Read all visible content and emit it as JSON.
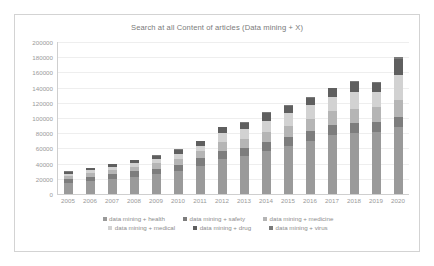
{
  "chart_data": {
    "type": "bar",
    "subtype": "stacked-column",
    "title": "Search at all Content of articles (Data mining + X)",
    "xlabel": "",
    "ylabel": "",
    "ylim": [
      0,
      200000
    ],
    "ytick_step": 20000,
    "yticks": [
      "200000",
      "180000",
      "160000",
      "140000",
      "120000",
      "100000",
      "80000",
      "60000",
      "40000",
      "20000",
      "0"
    ],
    "grid": true,
    "legend_position": "bottom",
    "categories": [
      "2005",
      "2006",
      "2007",
      "2008",
      "2009",
      "2010",
      "2011",
      "2012",
      "2013",
      "2014",
      "2015",
      "2016",
      "2017",
      "2018",
      "2019",
      "2020"
    ],
    "series": [
      {
        "name": "data mining + health",
        "color": "#9a9a9a",
        "values": [
          15000,
          17000,
          20000,
          23000,
          26000,
          30000,
          37000,
          46000,
          50000,
          57000,
          63000,
          70000,
          78000,
          80000,
          82000,
          88000
        ]
      },
      {
        "name": "data mining + safety",
        "color": "#7d7d7d",
        "values": [
          5000,
          6000,
          6500,
          7000,
          7500,
          8500,
          10000,
          11000,
          11000,
          12000,
          12500,
          13000,
          13000,
          13000,
          13000,
          14000
        ]
      },
      {
        "name": "data mining + medicine",
        "color": "#b5b5b5",
        "values": [
          4000,
          4500,
          5000,
          6000,
          7000,
          8000,
          9000,
          11000,
          12000,
          13000,
          14000,
          16000,
          18000,
          19000,
          19000,
          22000
        ]
      },
      {
        "name": "data mining + medical",
        "color": "#d2d2d2",
        "values": [
          3000,
          3500,
          4000,
          4500,
          5000,
          6000,
          7000,
          12000,
          12000,
          14000,
          17000,
          18000,
          19000,
          22000,
          20000,
          32000
        ]
      },
      {
        "name": "data mining + drug",
        "color": "#5f5f5f",
        "values": [
          2500,
          3000,
          3500,
          4000,
          5000,
          6000,
          6500,
          8000,
          9000,
          11000,
          10000,
          10000,
          11000,
          14000,
          12000,
          22000
        ]
      },
      {
        "name": "data mining + virus",
        "color": "#7a7a7a",
        "values": [
          400,
          400,
          500,
          500,
          600,
          600,
          600,
          700,
          700,
          800,
          900,
          900,
          900,
          1000,
          1000,
          2000
        ]
      }
    ],
    "totals": [
      29900,
      34400,
      39500,
      45000,
      51100,
      59100,
      70100,
      88700,
      94700,
      107800,
      117400,
      127900,
      139900,
      149000,
      147000,
      180000
    ]
  },
  "legend": {
    "row1": [
      {
        "label": "data mining + health",
        "color": "#9a9a9a"
      },
      {
        "label": "data mining + safety",
        "color": "#7d7d7d"
      },
      {
        "label": "data mining + medicine",
        "color": "#b5b5b5"
      }
    ],
    "row2": [
      {
        "label": "data mining + medical",
        "color": "#d2d2d2"
      },
      {
        "label": "data mining + drug",
        "color": "#5f5f5f"
      },
      {
        "label": "data mining + virus",
        "color": "#7a7a7a"
      }
    ]
  }
}
